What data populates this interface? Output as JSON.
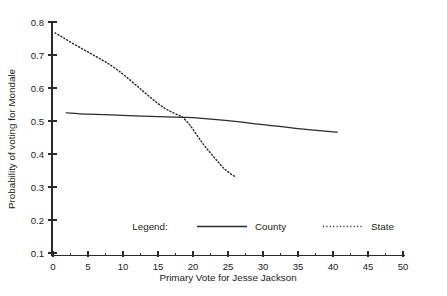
{
  "chart_data": {
    "type": "line",
    "title": "",
    "xlabel": "Primary Vote for Jesse Jackson",
    "ylabel": "Probability of voting for Mondale",
    "xlim": [
      0,
      50
    ],
    "ylim": [
      0.1,
      0.8
    ],
    "xticks": [
      0,
      5,
      10,
      15,
      20,
      25,
      30,
      35,
      40,
      45,
      50
    ],
    "xtick_labels": [
      "0",
      "5",
      "10",
      "15",
      "20",
      "25",
      "30",
      "35",
      "40",
      "45",
      "50"
    ],
    "yticks": [
      0.1,
      0.2,
      0.3,
      0.4,
      0.5,
      0.6,
      0.7,
      0.8
    ],
    "ytick_labels": [
      "0.1",
      "0.2",
      "0.3",
      "0.4",
      "0.5",
      "0.6",
      "0.7",
      "0.8"
    ],
    "xminor_step": 2.5,
    "grid": false,
    "legend_position": "inside-bottom",
    "series": [
      {
        "name": "County",
        "style": "solid",
        "color": "#2b2b2b",
        "x": [
          1.9,
          5.0,
          10.0,
          15.0,
          18.5,
          20.0,
          25.0,
          30.0,
          35.0,
          40.6
        ],
        "y": [
          0.525,
          0.521,
          0.517,
          0.513,
          0.511,
          0.51,
          0.501,
          0.489,
          0.477,
          0.466
        ]
      },
      {
        "name": "State",
        "style": "dotted",
        "color": "#2b2b2b",
        "x": [
          0.3,
          1.5,
          3.0,
          4.5,
          6.0,
          7.5,
          9.0,
          10.5,
          12.0,
          13.0,
          14.0,
          15.0,
          16.0,
          17.0,
          18.0,
          18.5,
          19.5,
          20.5,
          21.5,
          22.5,
          23.5,
          24.5,
          25.5,
          26.0
        ],
        "y": [
          0.767,
          0.752,
          0.733,
          0.715,
          0.697,
          0.679,
          0.658,
          0.633,
          0.606,
          0.588,
          0.57,
          0.553,
          0.538,
          0.527,
          0.517,
          0.512,
          0.489,
          0.459,
          0.429,
          0.403,
          0.378,
          0.355,
          0.338,
          0.332
        ]
      }
    ]
  },
  "legend": {
    "title": "Legend:",
    "entries": [
      {
        "label": "County",
        "style": "solid"
      },
      {
        "label": "State",
        "style": "dotted"
      }
    ]
  }
}
